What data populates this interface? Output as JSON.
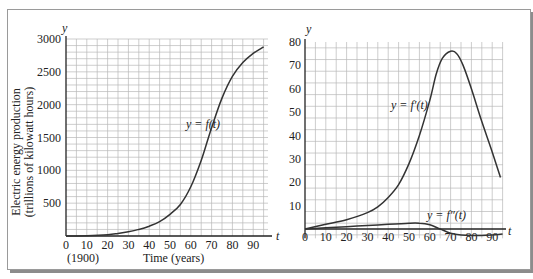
{
  "chart_data": [
    {
      "type": "line",
      "title": "",
      "xlabel": "Time (years)",
      "xlabel_note": "(1900)",
      "ylabel": "Electric energy production (trillions of kilowatt hours)",
      "x_axis_symbol": "t",
      "y_axis_symbol": "y",
      "xlim": [
        0,
        97
      ],
      "ylim": [
        0,
        3000
      ],
      "x_ticks": [
        0,
        10,
        20,
        30,
        40,
        50,
        60,
        70,
        80,
        90
      ],
      "y_ticks": [
        500,
        1000,
        1500,
        2000,
        2500,
        3000
      ],
      "grid": true,
      "series": [
        {
          "name": "y = f(t)",
          "x": [
            0,
            10,
            20,
            25,
            30,
            35,
            40,
            45,
            50,
            55,
            60,
            65,
            70,
            75,
            80,
            85,
            90,
            95
          ],
          "values": [
            0,
            5,
            20,
            40,
            65,
            100,
            150,
            220,
            330,
            480,
            750,
            1150,
            1650,
            2100,
            2430,
            2640,
            2780,
            2880
          ]
        }
      ],
      "annotations": [
        {
          "text": "y = f(t)",
          "x": 58,
          "y": 1900
        }
      ]
    },
    {
      "type": "line",
      "title": "",
      "xlabel": "",
      "ylabel": "",
      "x_axis_symbol": "t",
      "y_axis_symbol": "y",
      "xlim": [
        0,
        95
      ],
      "ylim": [
        -3,
        80
      ],
      "x_ticks": [
        0,
        10,
        20,
        30,
        40,
        50,
        60,
        70,
        80,
        90
      ],
      "y_ticks": [
        10,
        20,
        30,
        40,
        50,
        60,
        70,
        80
      ],
      "grid": true,
      "series": [
        {
          "name": "y = f'(t)",
          "x": [
            0,
            10,
            20,
            30,
            35,
            40,
            45,
            50,
            55,
            60,
            63,
            66,
            70,
            73,
            76,
            80,
            85,
            90,
            94
          ],
          "values": [
            0,
            2,
            4,
            7,
            9.5,
            13.5,
            19,
            28,
            40,
            55,
            66,
            73,
            76,
            75,
            70,
            60,
            46,
            33,
            22
          ]
        },
        {
          "name": "y = f''(t)",
          "x": [
            0,
            10,
            20,
            30,
            40,
            50,
            55,
            60,
            65,
            70,
            75,
            80,
            85,
            90,
            95
          ],
          "values": [
            0,
            0.5,
            1,
            1.5,
            2,
            2.5,
            2.5,
            1.8,
            0,
            -1.8,
            -2.6,
            -2.8,
            -2.8,
            -2.6,
            -2.2
          ]
        }
      ],
      "annotations": [
        {
          "text": "y = f'(t)",
          "x": 45,
          "y": 53
        },
        {
          "text": "y = f''(t)",
          "x": 58,
          "y": 5
        }
      ]
    }
  ],
  "left": {
    "y_sym": "y",
    "t_sym": "t",
    "ylabel1": "Electric energy production",
    "ylabel2": "(trillions of kilowatt hours)",
    "xlabel": "Time (years)",
    "year_note": "(1900)",
    "curve_label": "y = f(t)"
  },
  "right": {
    "y_sym": "y",
    "t_sym": "t",
    "curve1_label": "y = f′(t)",
    "curve2_label": "y = f″(t)"
  }
}
